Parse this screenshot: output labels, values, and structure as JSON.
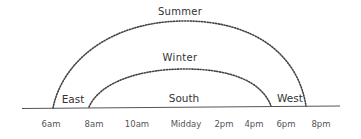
{
  "diagram": {
    "type": "sun-path",
    "colors": {
      "line": "#444444",
      "text": "#333333",
      "time_text": "#555555",
      "background": "#ffffff"
    },
    "arcs": [
      {
        "name": "Summer",
        "label": "Summer",
        "start_x": 53,
        "end_x": 306,
        "peak_y": 21,
        "style": "dotted"
      },
      {
        "name": "Winter",
        "label": "Winter",
        "start_x": 89,
        "end_x": 271,
        "peak_y": 69,
        "style": "dotted"
      }
    ],
    "directions": [
      {
        "label": "East"
      },
      {
        "label": "South"
      },
      {
        "label": "West"
      }
    ],
    "times": [
      {
        "label": "6am"
      },
      {
        "label": "8am"
      },
      {
        "label": "10am"
      },
      {
        "label": "Midday"
      },
      {
        "label": "2pm"
      },
      {
        "label": "4pm"
      },
      {
        "label": "6pm"
      },
      {
        "label": "8pm"
      }
    ]
  }
}
